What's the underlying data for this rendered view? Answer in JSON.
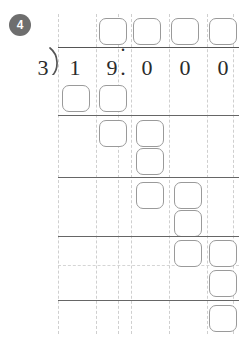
{
  "problem": {
    "number_label": "4",
    "badge_color": "#6e6e6e",
    "divisor": "3",
    "dividend_digits": [
      "1",
      "9",
      "0",
      "0",
      "0"
    ],
    "decimal_point": ".",
    "dividend_text": "19.000",
    "expression": "19.000 ÷ 3"
  },
  "quotient_row": {
    "decimal_point": ".",
    "boxes": [
      {
        "name": "quotient-box-ones",
        "value": ""
      },
      {
        "name": "quotient-box-tenths",
        "value": ""
      },
      {
        "name": "quotient-box-hundredths",
        "value": ""
      },
      {
        "name": "quotient-box-thousandths",
        "value": ""
      }
    ]
  },
  "work_rows": [
    {
      "name": "work-row-1",
      "boxes": [
        {
          "value": ""
        },
        {
          "value": ""
        }
      ]
    },
    {
      "name": "work-row-2",
      "boxes": [
        {
          "value": ""
        },
        {
          "value": ""
        }
      ]
    },
    {
      "name": "work-row-3",
      "boxes": [
        {
          "value": ""
        }
      ]
    },
    {
      "name": "work-row-4",
      "boxes": [
        {
          "value": ""
        },
        {
          "value": ""
        }
      ]
    },
    {
      "name": "work-row-5",
      "boxes": [
        {
          "value": ""
        }
      ]
    },
    {
      "name": "work-row-6",
      "boxes": [
        {
          "value": ""
        },
        {
          "value": ""
        }
      ]
    },
    {
      "name": "work-row-7",
      "boxes": [
        {
          "value": ""
        }
      ]
    },
    {
      "name": "work-row-8",
      "boxes": [
        {
          "value": ""
        }
      ]
    }
  ],
  "columns": {
    "count": 5,
    "x_positions": [
      58,
      96,
      131,
      169,
      207,
      233
    ]
  },
  "colors": {
    "box_border": "#9a9a9a",
    "guide_line": "#cfcfcf",
    "rule_line": "#666666",
    "digit": "#2b2b2b",
    "page": "#ffffff"
  }
}
